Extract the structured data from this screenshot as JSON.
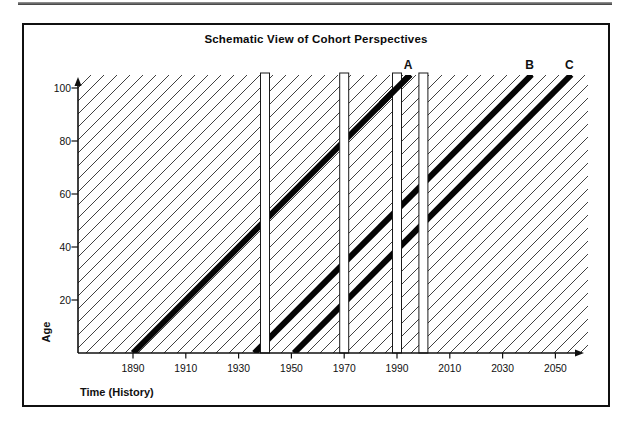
{
  "chart_data": {
    "type": "line",
    "title": "Schematic View of Cohort Perspectives",
    "xlabel": "Time (History)",
    "ylabel": "Age",
    "x_ticks": [
      1890,
      1910,
      1930,
      1950,
      1970,
      1990,
      2010,
      2030,
      2050
    ],
    "y_ticks": [
      20,
      40,
      60,
      80,
      100
    ],
    "x_axis_range_years": [
      1869,
      2061
    ],
    "y_axis_range_age": [
      0,
      105
    ],
    "grid": "off",
    "legend": "none",
    "cohort_lines": [
      {
        "label": "A",
        "birth_year": 1890
      },
      {
        "label": "B",
        "birth_year": 1936
      },
      {
        "label": "C",
        "birth_year": 1951
      }
    ],
    "period_bars_years": [
      1940,
      1970,
      1990,
      2000
    ],
    "background_hatch": {
      "style": "thin-diagonal-cohort-lines",
      "spacing_years": 5
    },
    "colors": {
      "cohort_line": "#050505",
      "hatch_line": "#2b2b2b",
      "axis": "#101010",
      "bar_fill": "#ffffff",
      "bar_outline": "#1a1a1a",
      "frame": "#101010",
      "background": "#ffffff"
    }
  }
}
